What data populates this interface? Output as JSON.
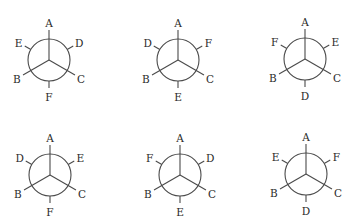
{
  "figure": {
    "line_color": "#4a4a4a",
    "text_color": "#2a2a2a",
    "background": "#ffffff"
  },
  "geometry": {
    "ring_radius": 21,
    "front_bond_length": 30,
    "back_stub_inner": 21,
    "back_stub_outer": 28,
    "label_radius": 37,
    "front_angles_deg": {
      "top": 90,
      "lower_left": 210,
      "lower_right": 330
    },
    "back_angles_deg": {
      "upper_left": 150,
      "upper_right": 30,
      "bottom": 270
    }
  },
  "projections": [
    {
      "id": 1,
      "center": [
        49,
        60
      ],
      "front": {
        "top": "A",
        "lower_left": "B",
        "lower_right": "C"
      },
      "back": {
        "upper_left": "E",
        "upper_right": "D",
        "bottom": "F"
      }
    },
    {
      "id": 2,
      "center": [
        178,
        60
      ],
      "front": {
        "top": "A",
        "lower_left": "B",
        "lower_right": "C"
      },
      "back": {
        "upper_left": "D",
        "upper_right": "F",
        "bottom": "E"
      }
    },
    {
      "id": 3,
      "center": [
        305,
        59
      ],
      "front": {
        "top": "A",
        "lower_left": "B",
        "lower_right": "C"
      },
      "back": {
        "upper_left": "F",
        "upper_right": "E",
        "bottom": "D"
      }
    },
    {
      "id": 4,
      "center": [
        50,
        175
      ],
      "front": {
        "top": "A",
        "lower_left": "B",
        "lower_right": "C"
      },
      "back": {
        "upper_left": "D",
        "upper_right": "E",
        "bottom": "F"
      }
    },
    {
      "id": 5,
      "center": [
        180,
        175
      ],
      "front": {
        "top": "A",
        "lower_left": "B",
        "lower_right": "C"
      },
      "back": {
        "upper_left": "F",
        "upper_right": "D",
        "bottom": "E"
      }
    },
    {
      "id": 6,
      "center": [
        306,
        174
      ],
      "front": {
        "top": "A",
        "lower_left": "B",
        "lower_right": "C"
      },
      "back": {
        "upper_left": "E",
        "upper_right": "F",
        "bottom": "D"
      }
    }
  ]
}
